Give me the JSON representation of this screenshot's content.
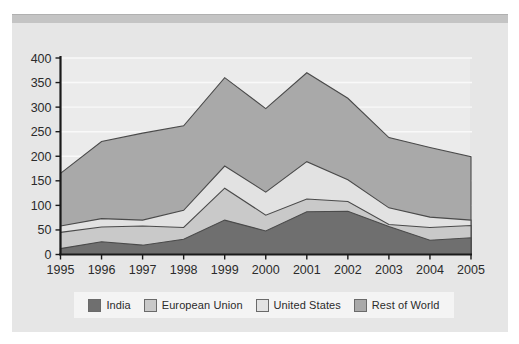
{
  "chart_data": {
    "type": "area",
    "stacked": true,
    "title": "",
    "subtitle": "",
    "xlabel": "",
    "ylabel": "",
    "grid": true,
    "grid_orientation": "horizontal",
    "legend_position": "bottom",
    "categories": [
      "1995",
      "1996",
      "1997",
      "1998",
      "1999",
      "2000",
      "2001",
      "2002",
      "2003",
      "2004",
      "2005"
    ],
    "x": [
      1995,
      1996,
      1997,
      1998,
      1999,
      2000,
      2001,
      2002,
      2003,
      2004,
      2005
    ],
    "xlim": [
      1995,
      2005
    ],
    "ylim": [
      0,
      400
    ],
    "yticks": [
      0,
      50,
      100,
      150,
      200,
      250,
      300,
      350,
      400
    ],
    "ytick_labels": [
      "0",
      "50",
      "100",
      "150",
      "200",
      "250",
      "300",
      "350",
      "400"
    ],
    "xtick_labels": [
      "1995",
      "1996",
      "1997",
      "1998",
      "1999",
      "2000",
      "2001",
      "2002",
      "2003",
      "2004",
      "2005"
    ],
    "series": [
      {
        "name": "India",
        "color": "#6f6f6f",
        "values": [
          12,
          26,
          19,
          31,
          70,
          48,
          87,
          88,
          57,
          29,
          34
        ]
      },
      {
        "name": "European Union",
        "color": "#c9c9c9",
        "values": [
          33,
          30,
          39,
          24,
          65,
          32,
          26,
          20,
          4,
          26,
          25
        ]
      },
      {
        "name": "United States",
        "color": "#e2e2e2",
        "values": [
          13,
          17,
          12,
          35,
          45,
          47,
          76,
          44,
          34,
          21,
          11
        ]
      },
      {
        "name": "Rest of World",
        "color": "#a9a9a9",
        "values": [
          107,
          157,
          177,
          172,
          180,
          170,
          181,
          166,
          143,
          142,
          129
        ]
      }
    ],
    "cumulative_tops": {
      "India": [
        12,
        26,
        19,
        31,
        70,
        48,
        87,
        88,
        57,
        29,
        34
      ],
      "European Union": [
        45,
        56,
        58,
        55,
        135,
        80,
        113,
        108,
        61,
        55,
        59
      ],
      "United States": [
        58,
        73,
        70,
        90,
        180,
        127,
        189,
        152,
        95,
        76,
        70
      ],
      "Rest of World": [
        165,
        230,
        247,
        262,
        360,
        297,
        370,
        318,
        238,
        218,
        199
      ]
    }
  },
  "legend": {
    "items": [
      {
        "label": "India",
        "color": "#6f6f6f"
      },
      {
        "label": "European Union",
        "color": "#c9c9c9"
      },
      {
        "label": "United States",
        "color": "#e2e2e2"
      },
      {
        "label": "Rest of World",
        "color": "#a9a9a9"
      }
    ]
  },
  "colors": {
    "panel_background": "#e6e6e6",
    "plot_background": "#ebebeb",
    "top_band": "#c4c4c4",
    "axis": "#1a1a1a",
    "gridline": "#f7f7f7",
    "legend_background": "#f4f4f4",
    "text": "#2b2b2b"
  }
}
